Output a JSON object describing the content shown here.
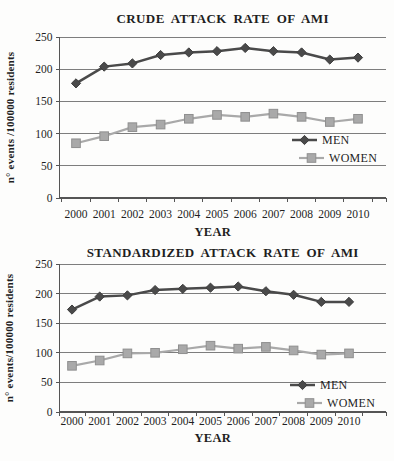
{
  "figure": {
    "background": "#fdfdfc",
    "text_color": "#1f1f1f",
    "grid_color": "#7d7d7d",
    "axis_color": "#555555"
  },
  "chart_data": [
    {
      "type": "line",
      "title": "CRUDE ATTACK RATE OF AMI",
      "xlabel": "YEAR",
      "ylabel": "n° events /100000 residents",
      "categories": [
        "2000",
        "2001",
        "2002",
        "2003",
        "2004",
        "2005",
        "2006",
        "2007",
        "2008",
        "2009",
        "2010"
      ],
      "ylim": [
        0,
        250
      ],
      "ytick_step": 50,
      "grid": true,
      "legend_position": "inside-right",
      "series": [
        {
          "name": "MEN",
          "marker": "diamond",
          "color": "#4a4a4a",
          "marker_stroke": "#3d3d3d",
          "values": [
            178,
            204,
            209,
            222,
            226,
            228,
            233,
            228,
            226,
            215,
            218
          ]
        },
        {
          "name": "WOMEN",
          "marker": "square",
          "color": "#a9a9a9",
          "marker_stroke": "#8f8f8f",
          "values": [
            85,
            96,
            110,
            114,
            123,
            129,
            126,
            131,
            126,
            118,
            123
          ]
        }
      ]
    },
    {
      "type": "line",
      "title": "STANDARDIZED ATTACK RATE OF AMI",
      "xlabel": "YEAR",
      "ylabel": "n° events/100000 residents",
      "categories": [
        "2000",
        "2001",
        "2002",
        "2003",
        "2004",
        "2005",
        "2006",
        "2007",
        "2008",
        "2009",
        "2010"
      ],
      "ylim": [
        0,
        250
      ],
      "ytick_step": 50,
      "grid": true,
      "legend_position": "inside-right",
      "series": [
        {
          "name": "MEN",
          "marker": "diamond",
          "color": "#4a4a4a",
          "marker_stroke": "#3d3d3d",
          "values": [
            173,
            195,
            197,
            206,
            208,
            210,
            212,
            204,
            198,
            186,
            186
          ]
        },
        {
          "name": "WOMEN",
          "marker": "square",
          "color": "#a9a9a9",
          "marker_stroke": "#8f8f8f",
          "values": [
            78,
            87,
            99,
            100,
            106,
            112,
            107,
            110,
            104,
            97,
            99
          ]
        }
      ]
    }
  ]
}
